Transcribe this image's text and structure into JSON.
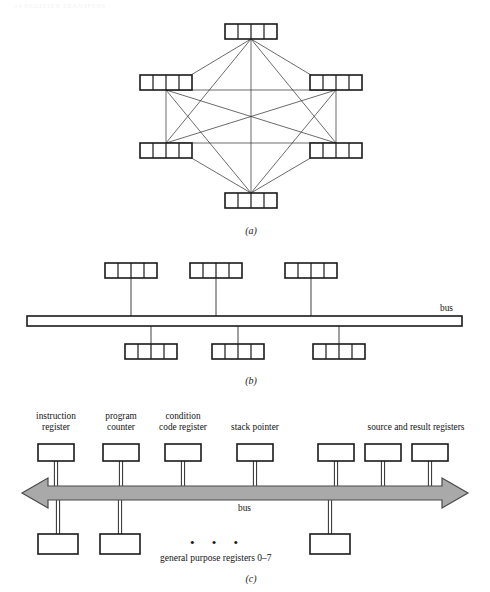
{
  "page": {
    "header": "24   REGISTER TRANSFERS"
  },
  "figures": [
    {
      "id": "a",
      "caption": "(a)",
      "type": "fully-connected-registers",
      "register_count": 6,
      "cells_per_register": 4,
      "registers": [
        {
          "name": "register-top",
          "x": 225,
          "y": 24,
          "w": 52,
          "h": 15,
          "hub_x": 251,
          "hub_y": 39
        },
        {
          "name": "register-upper-left",
          "x": 140,
          "y": 75,
          "w": 52,
          "h": 15,
          "hub_x": 166,
          "hub_y": 90
        },
        {
          "name": "register-upper-right",
          "x": 310,
          "y": 75,
          "w": 52,
          "h": 15,
          "hub_x": 336,
          "hub_y": 90
        },
        {
          "name": "register-lower-left",
          "x": 140,
          "y": 143,
          "w": 52,
          "h": 15,
          "hub_x": 166,
          "hub_y": 143
        },
        {
          "name": "register-lower-right",
          "x": 310,
          "y": 143,
          "w": 52,
          "h": 15,
          "hub_x": 336,
          "hub_y": 143
        },
        {
          "name": "register-bottom",
          "x": 225,
          "y": 193,
          "w": 52,
          "h": 15,
          "hub_x": 251,
          "hub_y": 193
        }
      ]
    },
    {
      "id": "b",
      "caption": "(b)",
      "type": "single-bus-registers",
      "bus_label": "bus",
      "bus": {
        "x": 27,
        "y": 316,
        "w": 435,
        "h": 10
      },
      "cells_per_register": 4,
      "registers_above": [
        {
          "name": "register-above-1",
          "x": 105,
          "y": 263,
          "w": 52,
          "h": 15,
          "stem_x": 131
        },
        {
          "name": "register-above-2",
          "x": 190,
          "y": 263,
          "w": 52,
          "h": 15,
          "stem_x": 216
        },
        {
          "name": "register-above-3",
          "x": 285,
          "y": 263,
          "w": 52,
          "h": 15,
          "stem_x": 311
        }
      ],
      "registers_below": [
        {
          "name": "register-below-1",
          "x": 125,
          "y": 344,
          "w": 52,
          "h": 15,
          "stem_x": 151
        },
        {
          "name": "register-below-2",
          "x": 212,
          "y": 344,
          "w": 52,
          "h": 15,
          "stem_x": 238
        },
        {
          "name": "register-below-3",
          "x": 313,
          "y": 344,
          "w": 52,
          "h": 15,
          "stem_x": 339
        }
      ]
    },
    {
      "id": "c",
      "caption": "(c)",
      "type": "bidirectional-bus-registers",
      "bus_label": "bus",
      "general_purpose_label": "general purpose registers 0–7",
      "ellipsis": "• • •",
      "bus_arrow": {
        "x": 22,
        "y": 478,
        "w": 446,
        "h": 30,
        "bar_top": 486,
        "bar_bottom": 500,
        "fill": "#a9a9a9",
        "stroke": "#4a4a4a"
      },
      "registers_above": [
        {
          "name": "instruction-register",
          "label": "instruction\nregister",
          "label_line1": "instruction",
          "label_line2": "register",
          "x": 38,
          "y": 444,
          "w": 36,
          "h": 17
        },
        {
          "name": "program-counter",
          "label_line1": "program",
          "label_line2": "counter",
          "x": 103,
          "y": 444,
          "w": 36,
          "h": 17
        },
        {
          "name": "condition-code-register",
          "label_line1": "condition",
          "label_line2": "code register",
          "x": 165,
          "y": 444,
          "w": 36,
          "h": 17
        },
        {
          "name": "stack-pointer",
          "label_line1": "stack pointer",
          "label_line2": "",
          "x": 237,
          "y": 444,
          "w": 36,
          "h": 17
        },
        {
          "name": "source-register-1",
          "label_line1": "",
          "label_line2": "",
          "x": 318,
          "y": 444,
          "w": 36,
          "h": 17
        },
        {
          "name": "source-register-2",
          "label_line1": "",
          "label_line2": "",
          "x": 365,
          "y": 444,
          "w": 36,
          "h": 17
        },
        {
          "name": "result-register",
          "label_line1": "",
          "label_line2": "",
          "x": 412,
          "y": 444,
          "w": 36,
          "h": 17
        }
      ],
      "group_label": "source and result registers",
      "registers_below": [
        {
          "name": "gp-register-0",
          "x": 38,
          "y": 534,
          "w": 40,
          "h": 20
        },
        {
          "name": "gp-register-1",
          "x": 100,
          "y": 534,
          "w": 40,
          "h": 20
        },
        {
          "name": "gp-register-7",
          "x": 310,
          "y": 534,
          "w": 40,
          "h": 20
        }
      ]
    }
  ]
}
